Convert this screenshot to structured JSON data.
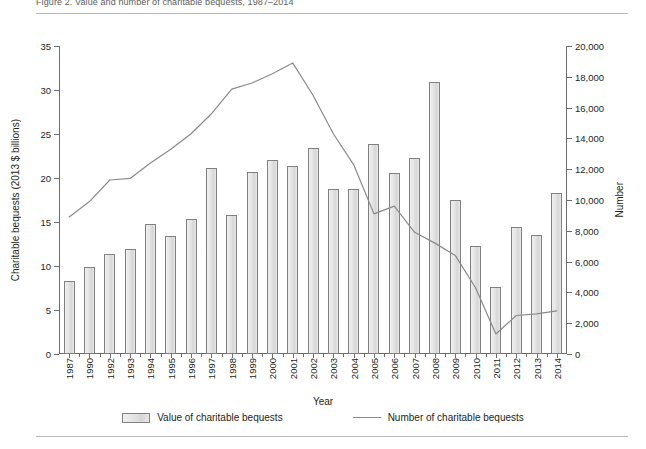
{
  "figure": {
    "title": "Figure 2.  Value and number of charitable bequests, 1987–2014",
    "xlabel": "Year",
    "ylabel_left": "Charitable bequests (2013 $ billions)",
    "ylabel_right": "Number"
  },
  "legend": {
    "position": "bottom",
    "items": [
      {
        "label": "Value of charitable bequests",
        "marker": "bar-swatch"
      },
      {
        "label": "Number of charitable bequests",
        "marker": "line-swatch"
      }
    ]
  },
  "axes": {
    "left": {
      "ticks": [
        "0",
        "5",
        "10",
        "15",
        "20",
        "25",
        "30",
        "35"
      ],
      "min": 0,
      "max": 35
    },
    "right": {
      "ticks": [
        "0",
        "2,000",
        "4,000",
        "6,000",
        "8,000",
        "10,000",
        "12,000",
        "14,000",
        "16,000",
        "18,000",
        "20,000"
      ],
      "min": 0,
      "max": 20000
    }
  },
  "chart_data": {
    "type": "bar",
    "title": "Value and number of charitable bequests, 1987–2014",
    "xlabel": "Year",
    "ylabel": "Charitable bequests (2013 $ billions)",
    "ylabel_secondary": "Number",
    "ylim": [
      0,
      35
    ],
    "ylim_secondary": [
      0,
      20000
    ],
    "grid": false,
    "legend_position": "bottom",
    "categories": [
      "1987",
      "1990",
      "1992",
      "1993",
      "1994",
      "1995",
      "1996",
      "1997",
      "1998",
      "1999",
      "2000",
      "2001",
      "2002",
      "2003",
      "2004",
      "2005",
      "2006",
      "2007",
      "2008",
      "2009",
      "2010",
      "2011",
      "2012",
      "2013",
      "2014"
    ],
    "series": [
      {
        "name": "Value of charitable bequests",
        "type": "bar",
        "axis": "left",
        "unit": "2013 $ billions",
        "values": [
          8.3,
          9.9,
          11.4,
          11.9,
          14.8,
          13.4,
          15.3,
          21.1,
          15.8,
          20.7,
          22.1,
          21.4,
          23.4,
          18.7,
          18.8,
          23.9,
          20.6,
          22.3,
          30.9,
          17.5,
          12.3,
          7.6,
          14.4,
          13.5,
          18.3
        ]
      },
      {
        "name": "Number of charitable bequests",
        "type": "line",
        "axis": "right",
        "unit": "Number",
        "values": [
          8900,
          9900,
          11300,
          11400,
          12400,
          13300,
          14300,
          15600,
          17200,
          17600,
          18200,
          18900,
          16800,
          14300,
          12300,
          9100,
          9600,
          7900,
          7200,
          6400,
          4300,
          1300,
          2500,
          2600,
          2800
        ]
      }
    ]
  }
}
